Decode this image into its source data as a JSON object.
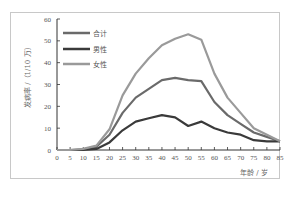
{
  "chart_data": {
    "type": "line",
    "title": "",
    "xlabel": "年龄 / 岁",
    "ylabel": "发病率 /（1/10 万）",
    "xlim": [
      0,
      85
    ],
    "ylim": [
      0,
      60
    ],
    "x_ticks": [
      0,
      5,
      10,
      15,
      20,
      25,
      30,
      35,
      40,
      45,
      50,
      55,
      60,
      65,
      70,
      75,
      80,
      85
    ],
    "y_ticks": [
      0,
      10,
      20,
      30,
      40,
      50,
      60
    ],
    "grid": false,
    "legend_position": "upper-left",
    "x": [
      0,
      5,
      10,
      15,
      20,
      25,
      30,
      35,
      40,
      45,
      50,
      55,
      60,
      65,
      70,
      75,
      80,
      85
    ],
    "series": [
      {
        "name": "合计",
        "color": "#6a6a6a",
        "values": [
          0,
          0,
          0.3,
          1.5,
          7,
          17,
          24,
          28,
          32,
          33,
          32,
          31.5,
          22,
          16,
          12,
          8,
          6,
          4
        ]
      },
      {
        "name": "男性",
        "color": "#3a3a3a",
        "values": [
          0,
          0,
          0.1,
          0.5,
          3.5,
          9,
          13,
          14.5,
          16,
          15,
          11,
          13,
          10,
          8,
          7,
          4.5,
          4,
          4
        ]
      },
      {
        "name": "女性",
        "color": "#9a9a9a",
        "values": [
          0,
          0,
          0.5,
          2,
          9.5,
          25,
          35,
          42,
          48,
          51,
          53,
          50.5,
          35,
          24,
          17,
          10,
          7,
          4
        ]
      }
    ]
  },
  "labels": {
    "xlabel": "年龄 / 岁",
    "ylabel": "发病率 /（1/10 万）"
  }
}
